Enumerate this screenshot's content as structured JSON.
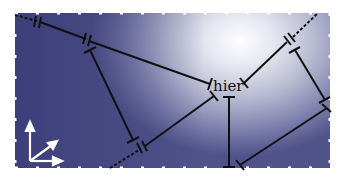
{
  "diagram": {
    "center_label": "hier",
    "colors": {
      "background_dark": "#50528a",
      "background_light": "#ffffff",
      "line": "#111111",
      "axes": "#ffffff",
      "border_dots": "#ffffff"
    },
    "elements": [
      {
        "type": "dashed-line",
        "from": [
          15,
          15
        ],
        "to": [
          38,
          21
        ]
      },
      {
        "type": "double-tick",
        "at": [
          40,
          22
        ]
      },
      {
        "type": "solid-line",
        "from": [
          42,
          22
        ],
        "to": [
          85,
          39
        ]
      },
      {
        "type": "double-tick",
        "at": [
          87,
          40
        ]
      },
      {
        "type": "solid-line",
        "from": [
          89,
          41
        ],
        "to": [
          210,
          84
        ],
        "end": "tee"
      },
      {
        "type": "solid-line",
        "from": [
          90,
          50
        ],
        "to": [
          133,
          140
        ],
        "ends": "tee"
      },
      {
        "type": "dashed-line",
        "from": [
          110,
          168
        ],
        "to": [
          140,
          149
        ]
      },
      {
        "type": "double-tick",
        "at": [
          142,
          148
        ]
      },
      {
        "type": "solid-line",
        "from": [
          144,
          146
        ],
        "to": [
          214,
          96
        ],
        "end": "tee"
      },
      {
        "type": "i-beam",
        "x": 229,
        "from_y": 97,
        "to_y": 168
      },
      {
        "type": "solid-line",
        "from": [
          244,
          83
        ],
        "to": [
          288,
          41
        ],
        "end": "tee"
      },
      {
        "type": "double-tick",
        "at": [
          290,
          40
        ]
      },
      {
        "type": "dashed-line",
        "from": [
          292,
          38
        ],
        "to": [
          318,
          13
        ]
      },
      {
        "type": "solid-line",
        "from": [
          295,
          50
        ],
        "to": [
          325,
          100
        ],
        "ends": "tee"
      },
      {
        "type": "solid-line",
        "from": [
          327,
          108
        ],
        "to": [
          240,
          165
        ],
        "ends": "tee"
      }
    ],
    "axes_icon": {
      "origin": [
        30,
        162
      ],
      "directions": [
        "up",
        "diagonal",
        "right"
      ]
    }
  }
}
